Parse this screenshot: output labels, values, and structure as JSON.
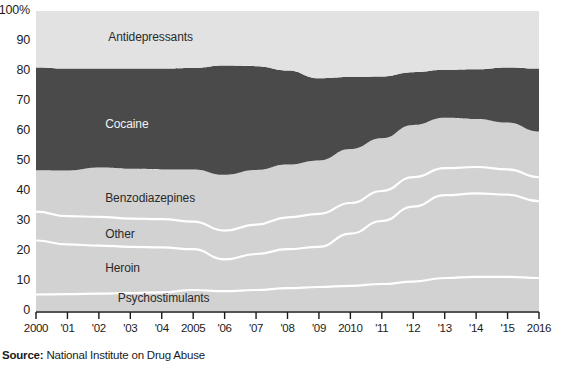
{
  "source": {
    "prefix": "Source:",
    "text": " National Institute on Drug Abuse"
  },
  "colors": {
    "cocaine_band": "#4a4a4a",
    "other_bands": "#d2d2d2",
    "top_band": "#e2e2e2",
    "separator": "#ffffff",
    "axis": "#1b1b1b",
    "label_dark": "#2a2a2a",
    "label_light": "#f2f2f2"
  },
  "chart_data": {
    "type": "area",
    "stacked": true,
    "normalized_percent": true,
    "title": "",
    "subtitle": "",
    "xlabel": "",
    "ylabel": "",
    "ylim": [
      0,
      100
    ],
    "grid": false,
    "legend_position": "inline-band-labels",
    "x": [
      2000,
      2001,
      2002,
      2003,
      2004,
      2005,
      2006,
      2007,
      2008,
      2009,
      2010,
      2011,
      2012,
      2013,
      2014,
      2015,
      2016
    ],
    "tick_labels": [
      "2000",
      "'01",
      "'02",
      "'03",
      "'04",
      "2005",
      "'06",
      "'07",
      "'08",
      "'09",
      "2010",
      "'11",
      "'12",
      "'13",
      "'14",
      "'15",
      "2016"
    ],
    "ytick_labels": [
      "0",
      "10",
      "20",
      "30",
      "40",
      "50",
      "60",
      "70",
      "80",
      "90",
      "100%"
    ],
    "ytick_values": [
      0,
      10,
      20,
      30,
      40,
      50,
      60,
      70,
      80,
      90,
      100
    ],
    "series": [
      {
        "name": "Psychostimulants",
        "label_x": 2002.6,
        "label_y": 4.0,
        "label_on_dark": false,
        "values": [
          5.5,
          5.6,
          5.8,
          6.0,
          6.2,
          7.0,
          6.6,
          7.0,
          7.6,
          8.0,
          8.4,
          9.0,
          9.8,
          11.0,
          11.4,
          11.4,
          11.0
        ]
      },
      {
        "name": "Heroin",
        "label_x": 2002.2,
        "label_y": 14.0,
        "label_on_dark": false,
        "values": [
          18.0,
          16.6,
          16.0,
          15.4,
          15.0,
          13.6,
          10.6,
          12.0,
          13.0,
          13.4,
          17.4,
          21.0,
          25.0,
          27.6,
          27.8,
          27.4,
          25.6
        ]
      },
      {
        "name": "Other",
        "label_x": 2002.2,
        "label_y": 25.5,
        "label_on_dark": false,
        "values": [
          9.6,
          9.4,
          9.6,
          9.4,
          9.4,
          9.2,
          9.6,
          9.8,
          10.6,
          11.0,
          10.2,
          10.0,
          9.8,
          9.0,
          8.8,
          8.4,
          8.0
        ]
      },
      {
        "name": "Benzodiazepines",
        "label_x": 2002.2,
        "label_y": 37.5,
        "label_on_dark": false,
        "values": [
          13.8,
          15.2,
          16.4,
          16.6,
          16.6,
          17.4,
          18.6,
          18.2,
          17.6,
          17.8,
          18.0,
          17.6,
          17.4,
          16.8,
          16.0,
          15.6,
          15.2
        ]
      },
      {
        "name": "Cocaine",
        "label_x": 2002.2,
        "label_y": 62.0,
        "label_on_dark": true,
        "values": [
          34.3,
          34.0,
          33.0,
          33.4,
          33.6,
          33.8,
          36.4,
          34.6,
          31.4,
          27.4,
          24.0,
          20.6,
          17.6,
          16.0,
          16.6,
          18.4,
          21.0
        ]
      },
      {
        "name": "Antidepressants",
        "label_x": 2002.3,
        "label_y": 91.0,
        "label_on_dark": false,
        "values": [
          18.8,
          19.2,
          19.2,
          19.2,
          19.2,
          19.0,
          18.2,
          18.4,
          19.8,
          22.4,
          22.0,
          21.8,
          20.4,
          19.6,
          19.4,
          18.8,
          19.2
        ]
      }
    ]
  }
}
